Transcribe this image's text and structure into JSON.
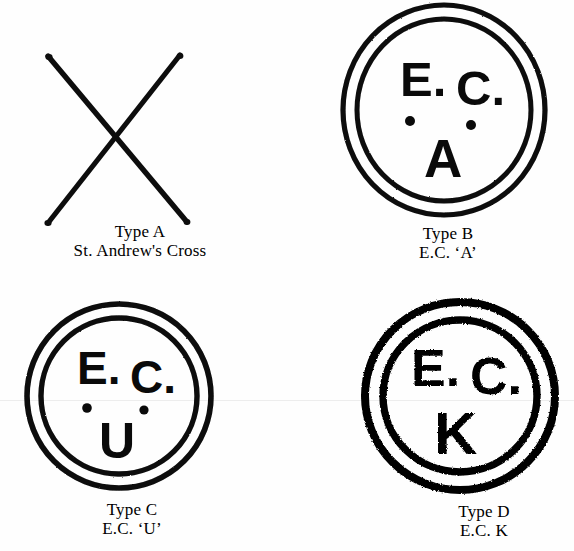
{
  "figure": {
    "background_color": "#fefefe",
    "ink_color": "#000000",
    "kind": "postal-marking-plate",
    "items": [
      {
        "id": "a",
        "mark_type": "saltire-cross",
        "inner_text": "",
        "caption": {
          "line1": "Type A",
          "line2": "St. Andrew's Cross"
        }
      },
      {
        "id": "b",
        "mark_type": "double-ring-circle",
        "inner_text": {
          "top_left": "E.",
          "top_right": "C.",
          "dots": 2,
          "bottom": "A"
        },
        "caption": {
          "line1": "Type B",
          "line2": "E.C. ‘A’"
        }
      },
      {
        "id": "c",
        "mark_type": "double-ring-circle",
        "inner_text": {
          "top_left": "E.",
          "top_right": "C.",
          "dots": 2,
          "bottom": "U"
        },
        "caption": {
          "line1": "Type C",
          "line2": "E.C. ‘U’"
        }
      },
      {
        "id": "d",
        "mark_type": "double-ring-circle-bold",
        "inner_text": {
          "top_left": "E.",
          "top_right": "C.",
          "dots": 0,
          "bottom": "K"
        },
        "caption": {
          "line1": "Type D",
          "line2": "E.C. K"
        }
      }
    ]
  }
}
